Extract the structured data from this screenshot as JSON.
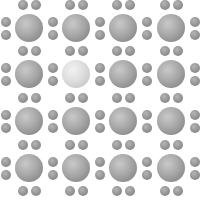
{
  "figure": {
    "grid": {
      "rows": 4,
      "cols": 4
    },
    "big_centers_x": [
      29,
      76,
      123,
      171
    ],
    "big_centers_y": [
      28,
      74,
      121,
      168
    ],
    "big_radius": 14,
    "dot_radius": 5,
    "highlighted_cell": {
      "row": 1,
      "col": 1
    },
    "colors": {
      "background": "#ffffff",
      "sphere": "#a0a0a0",
      "sphere_highlight": "#dcdcdc",
      "dot": "#909090"
    }
  }
}
